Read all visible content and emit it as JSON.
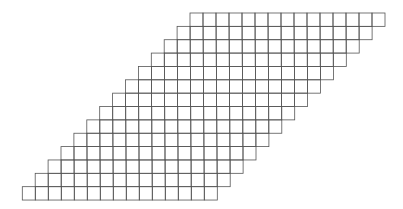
{
  "diagram": {
    "type": "staircase-parallelogram-grid",
    "rows": 14,
    "cells_per_row": 15,
    "cell_width": 13,
    "cell_height": 13.36,
    "row_shift": 12.9,
    "origin_top_left": [
      190,
      13
    ],
    "bottom_left": [
      22,
      200
    ],
    "stroke_color": "#555555",
    "background": "#ffffff"
  }
}
